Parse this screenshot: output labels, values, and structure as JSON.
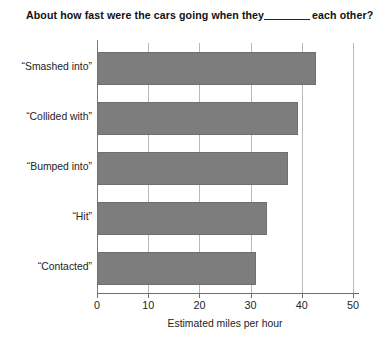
{
  "chart_data": {
    "type": "bar",
    "orientation": "horizontal",
    "title": "About how fast were the cars going when they",
    "title_after_blank": "each other?",
    "title_blank": "______",
    "categories": [
      "“Smashed into”",
      "“Collided with”",
      "“Bumped into”",
      "“Hit”",
      "“Contacted”"
    ],
    "values": [
      42.8,
      39.3,
      37.4,
      33.2,
      31.0
    ],
    "xlabel": "Estimated miles per hour",
    "ylabel": "",
    "xticks": [
      0,
      10,
      20,
      30,
      40,
      50
    ],
    "xtick_labels": [
      "0",
      "10",
      "20",
      "30",
      "40",
      "50"
    ],
    "xlim": [
      0,
      50
    ],
    "grid": true,
    "grid_axis": "x",
    "legend": false,
    "bar_color": "#7d7d7d",
    "bar_edge_color": "#6f6f6f",
    "background_color": "#ffffff",
    "axis_color": "#6e6e6e",
    "gridline_color": "#b9b9b9"
  }
}
